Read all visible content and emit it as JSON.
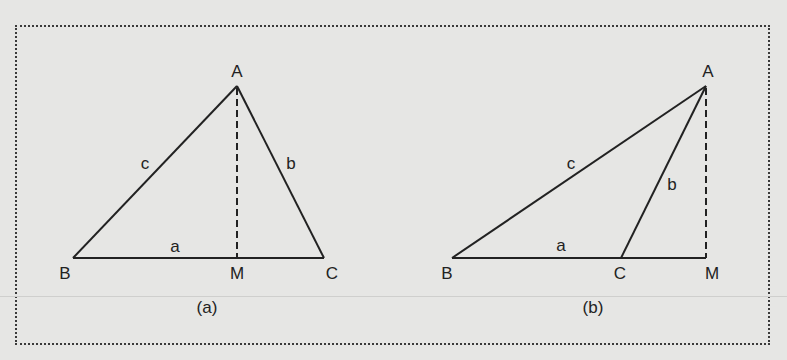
{
  "colors": {
    "background": "#e6e6e4",
    "ink": "#222222",
    "frame": "#3a3a3a"
  },
  "figures": [
    {
      "id": "a",
      "caption": "(a)",
      "description": "Acute triangle ABC with altitude AM dropped to side BC, foot M lies between B and C",
      "vertices": {
        "A": {
          "label": "A",
          "x": 237,
          "y": 86
        },
        "B": {
          "label": "B",
          "x": 73,
          "y": 258
        },
        "C": {
          "label": "C",
          "x": 324,
          "y": 258
        },
        "M": {
          "label": "M",
          "x": 237,
          "y": 258
        }
      },
      "sides": {
        "a": "a",
        "b": "b",
        "c": "c"
      },
      "altitude": "AM (dashed)"
    },
    {
      "id": "b",
      "caption": "(b)",
      "description": "Obtuse triangle ABC with altitude AM dropped to extension of BC, foot M lies beyond C",
      "vertices": {
        "A": {
          "label": "A",
          "x": 706,
          "y": 86
        },
        "B": {
          "label": "B",
          "x": 452,
          "y": 258
        },
        "C": {
          "label": "C",
          "x": 621,
          "y": 258
        },
        "M": {
          "label": "M",
          "x": 706,
          "y": 258
        }
      },
      "sides": {
        "a": "a",
        "b": "b",
        "c": "c"
      },
      "altitude": "AM (dashed)"
    }
  ]
}
